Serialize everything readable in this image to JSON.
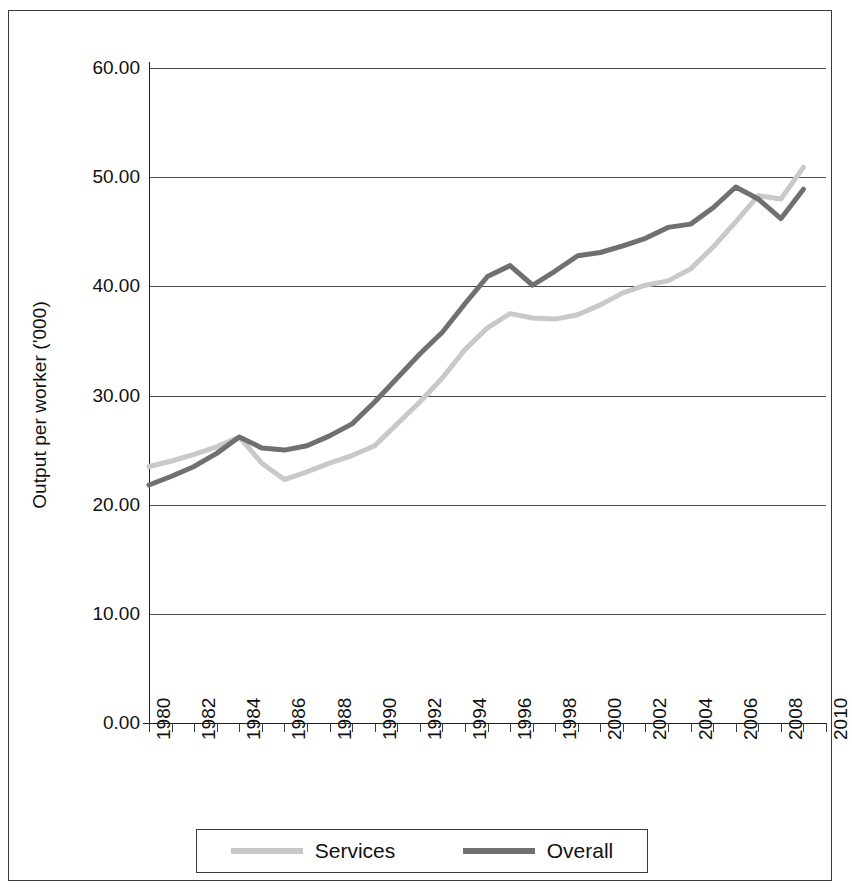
{
  "chart_data": {
    "type": "line",
    "title": "",
    "xlabel": "",
    "ylabel": "Output per worker ('000)",
    "xlim": [
      1980,
      2010
    ],
    "ylim": [
      0,
      60
    ],
    "grid": true,
    "legend_position": "bottom",
    "ytick_labels": [
      "60.00",
      "50.00",
      "40.00",
      "30.00",
      "20.00",
      "10.00",
      "0.00"
    ],
    "ytick_values": [
      60,
      50,
      40,
      30,
      20,
      10,
      0
    ],
    "xtick_labels": [
      "1980",
      "1982",
      "1984",
      "1986",
      "1988",
      "1990",
      "1992",
      "1994",
      "1996",
      "1998",
      "2000",
      "2002",
      "2004",
      "2006",
      "2008",
      "2010"
    ],
    "x": [
      1980,
      1981,
      1982,
      1983,
      1984,
      1985,
      1986,
      1987,
      1988,
      1989,
      1990,
      1991,
      1992,
      1993,
      1994,
      1995,
      1996,
      1997,
      1998,
      1999,
      2000,
      2001,
      2002,
      2003,
      2004,
      2005,
      2006,
      2007,
      2008,
      2009
    ],
    "series": [
      {
        "name": "Services",
        "color": "#c9c9c9",
        "values": [
          23.5,
          24.0,
          24.6,
          25.3,
          26.2,
          23.8,
          22.3,
          23.0,
          23.8,
          24.5,
          25.4,
          27.4,
          29.4,
          31.6,
          34.2,
          36.2,
          37.5,
          37.1,
          37.0,
          37.4,
          38.3,
          39.4,
          40.1,
          40.5,
          41.6,
          43.6,
          45.9,
          48.3,
          48.0,
          50.9
        ]
      },
      {
        "name": "Overall",
        "color": "#707070",
        "values": [
          21.8,
          22.6,
          23.5,
          24.7,
          26.2,
          25.2,
          25.0,
          25.4,
          26.3,
          27.4,
          29.4,
          31.6,
          33.8,
          35.8,
          38.4,
          40.9,
          41.9,
          40.1,
          41.4,
          42.8,
          43.1,
          43.7,
          44.4,
          45.4,
          45.7,
          47.2,
          49.1,
          48.0,
          46.2,
          48.9
        ]
      }
    ]
  },
  "legend": {
    "items": [
      {
        "label": "Services",
        "color": "#c9c9c9"
      },
      {
        "label": "Overall",
        "color": "#707070"
      }
    ]
  }
}
